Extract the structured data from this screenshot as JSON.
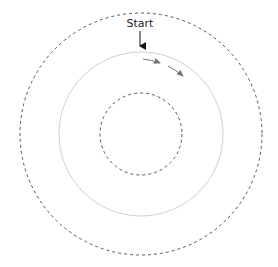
{
  "diagram": {
    "start_label": "Start",
    "center": {
      "x": 141,
      "y": 134
    },
    "circles": [
      {
        "name": "outer",
        "radius": 121,
        "style": "dashed",
        "color": "#555555"
      },
      {
        "name": "middle",
        "radius": 82,
        "style": "solid",
        "color": "#d0d0d0"
      },
      {
        "name": "inner",
        "radius": 41,
        "style": "dashed",
        "color": "#555555"
      }
    ],
    "direction_arrows": {
      "count": 2,
      "color": "#777777",
      "direction": "clockwise"
    },
    "start_arrow_color": "#111111"
  }
}
